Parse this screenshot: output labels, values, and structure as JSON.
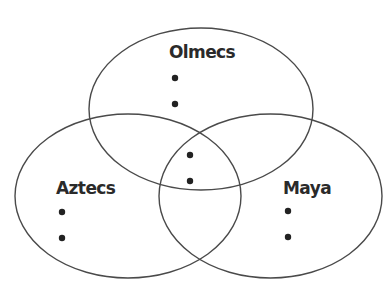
{
  "diagram": {
    "type": "venn-3",
    "sets": [
      {
        "id": "olmecs",
        "label": "Olmecs",
        "bullets": [
          "",
          ""
        ]
      },
      {
        "id": "aztecs",
        "label": "Aztecs",
        "bullets": [
          "",
          ""
        ]
      },
      {
        "id": "maya",
        "label": "Maya",
        "bullets": [
          "",
          ""
        ]
      }
    ],
    "overlap_all": {
      "bullets": [
        "",
        ""
      ]
    },
    "stroke_color": "#4a4a4a",
    "text_color": "#2a2a2a"
  }
}
